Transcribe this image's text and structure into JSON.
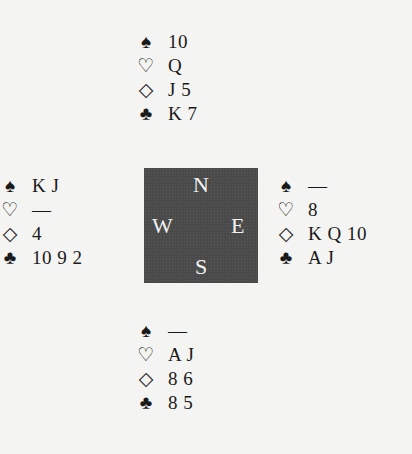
{
  "suits": {
    "spades": "♠",
    "hearts": "♡",
    "diamonds": "◇",
    "clubs": "♣"
  },
  "hands": {
    "north": {
      "spades": "10",
      "hearts": "Q",
      "diamonds": "J 5",
      "clubs": "K 7"
    },
    "west": {
      "spades": "K J",
      "hearts": "—",
      "diamonds": "4",
      "clubs": "10 9 2"
    },
    "east": {
      "spades": "—",
      "hearts": "8",
      "diamonds": "K Q 10",
      "clubs": "A J"
    },
    "south": {
      "spades": "—",
      "hearts": "A J",
      "diamonds": "8 6",
      "clubs": "8 5"
    }
  },
  "compass": {
    "n": "N",
    "w": "W",
    "e": "E",
    "s": "S"
  }
}
